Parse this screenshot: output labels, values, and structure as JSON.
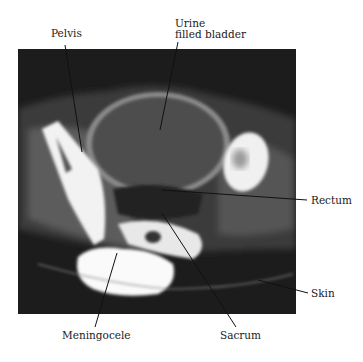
{
  "figure": {
    "type": "annotated axial CT scan of pelvis",
    "labels": {
      "pelvis": "Pelvis",
      "bladder_line1": "Urine",
      "bladder_line2": "filled bladder",
      "rectum": "Rectum",
      "skin": "Skin",
      "meningocele": "Meningocele",
      "sacrum": "Sacrum"
    }
  },
  "colors": {
    "background": "#ffffff",
    "scan_background": "#1c1c1c",
    "bone": "#f4f4f4",
    "bladder": "#4a4a4a",
    "soft_tissue": "#6e6e6e",
    "text": "#1a1a1a"
  }
}
